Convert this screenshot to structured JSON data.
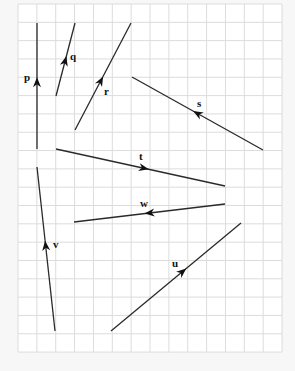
{
  "grid": {
    "left": 18,
    "top": 4,
    "cols": 14,
    "rows": 19,
    "cell_w": 18.86,
    "cell_h": 18.32,
    "background": "#ffffff",
    "line_color": "#dcdcdc",
    "page_background": "#f7f7f7"
  },
  "vectors": [
    {
      "label": "p",
      "from": [
        37,
        149
      ],
      "to": [
        37,
        23
      ],
      "arrow_at": 0.53,
      "label_pos": [
        24,
        81
      ]
    },
    {
      "label": "q",
      "from": [
        56,
        96
      ],
      "to": [
        75,
        23
      ],
      "arrow_at": 0.48,
      "label_pos": [
        70,
        60
      ]
    },
    {
      "label": "r",
      "from": [
        75,
        130
      ],
      "to": [
        131,
        23
      ],
      "arrow_at": 0.46,
      "label_pos": [
        104,
        95
      ]
    },
    {
      "label": "s",
      "from": [
        263,
        150
      ],
      "to": [
        132,
        77
      ],
      "arrow_at": 0.5,
      "label_pos": [
        197,
        107
      ]
    },
    {
      "label": "t",
      "from": [
        56,
        149
      ],
      "to": [
        225,
        186
      ],
      "arrow_at": 0.52,
      "label_pos": [
        139,
        160
      ]
    },
    {
      "label": "w",
      "from": [
        225,
        204
      ],
      "to": [
        74,
        222
      ],
      "arrow_at": 0.5,
      "label_pos": [
        140,
        207
      ]
    },
    {
      "label": "v",
      "from": [
        55,
        331
      ],
      "to": [
        37,
        167
      ],
      "arrow_at": 0.52,
      "label_pos": [
        53,
        248
      ]
    },
    {
      "label": "u",
      "from": [
        111,
        331
      ],
      "to": [
        241,
        223
      ],
      "arrow_at": 0.55,
      "label_pos": [
        172,
        267
      ]
    }
  ],
  "colors": {
    "vector": "#2a2a2a",
    "label": "#111111"
  }
}
